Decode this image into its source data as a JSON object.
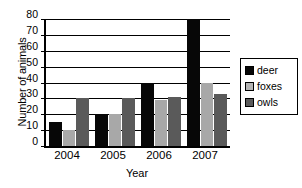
{
  "chart_data": {
    "type": "bar",
    "title": "",
    "xlabel": "Year",
    "ylabel": "Number of animals",
    "categories": [
      "2004",
      "2005",
      "2006",
      "2007"
    ],
    "series": [
      {
        "name": "deer",
        "color": "#070707",
        "values": [
          15,
          20,
          40,
          80
        ]
      },
      {
        "name": "foxes",
        "color": "#a8a8a8",
        "values": [
          10,
          20,
          29,
          40
        ]
      },
      {
        "name": "owls",
        "color": "#5a5a5a",
        "values": [
          30,
          30,
          31,
          33
        ]
      }
    ],
    "ylim": [
      0,
      80
    ],
    "yticks": [
      0,
      10,
      20,
      30,
      40,
      50,
      60,
      70,
      80
    ],
    "ytick_labels": [
      "0",
      "10",
      "20",
      "30",
      "40",
      "50",
      "60",
      "70",
      "80"
    ],
    "grid": true,
    "grid_axis": "y",
    "legend_position": "right",
    "legend_entries": [
      "deer",
      "foxes",
      "owls"
    ]
  },
  "legend": {
    "items": [
      {
        "label": "deer"
      },
      {
        "label": "foxes"
      },
      {
        "label": "owls"
      }
    ]
  },
  "axes": {
    "y_title": "Number of animals",
    "x_title": "Year"
  }
}
